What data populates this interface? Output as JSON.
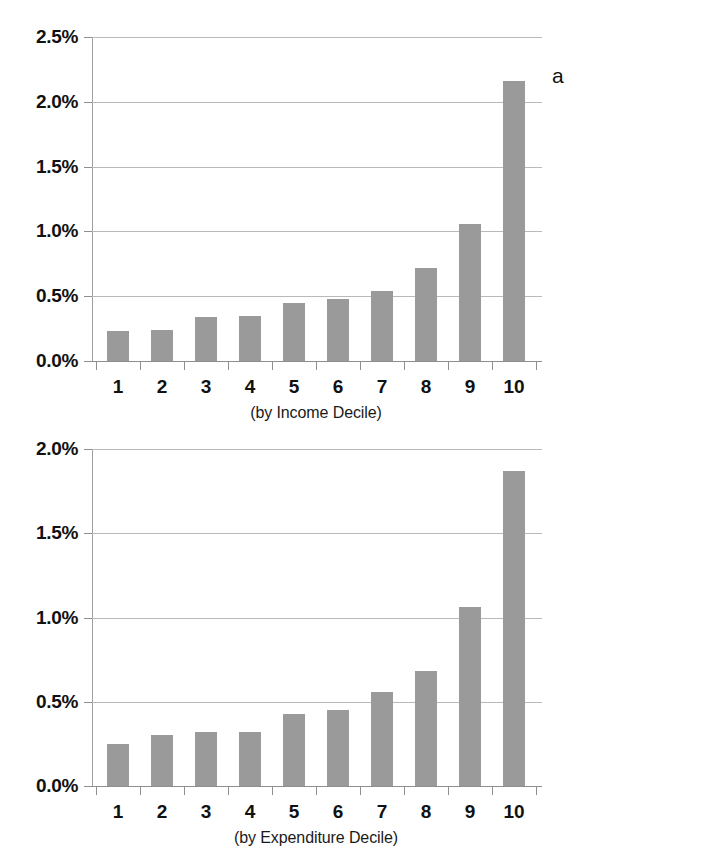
{
  "figure": {
    "panel_a_letter": "a",
    "panel_b_letter": "b",
    "caption": ""
  },
  "chart_data": [
    {
      "id": "a",
      "type": "bar",
      "title": "",
      "xlabel": "(by Income Decile)",
      "ylabel": "",
      "categories": [
        "1",
        "2",
        "3",
        "4",
        "5",
        "6",
        "7",
        "8",
        "9",
        "10"
      ],
      "values": [
        0.23,
        0.24,
        0.34,
        0.35,
        0.45,
        0.48,
        0.54,
        0.72,
        1.06,
        2.16
      ],
      "value_unit": "%",
      "ylim": [
        0,
        2.5
      ],
      "ytick_values": [
        0.0,
        0.5,
        1.0,
        1.5,
        2.0,
        2.5
      ],
      "ytick_labels": [
        "0.0%",
        "0.5%",
        "1.0%",
        "1.5%",
        "2.0%",
        "2.5%"
      ],
      "grid": true,
      "legend": "none",
      "bar_color": "#9a9a9a",
      "gridline_color": "#b9b9b9",
      "panel_label": "a"
    },
    {
      "id": "b",
      "type": "bar",
      "title": "",
      "xlabel": "(by Expenditure Decile)",
      "ylabel": "",
      "categories": [
        "1",
        "2",
        "3",
        "4",
        "5",
        "6",
        "7",
        "8",
        "9",
        "10"
      ],
      "values": [
        0.25,
        0.3,
        0.32,
        0.32,
        0.43,
        0.45,
        0.56,
        0.68,
        1.06,
        1.87
      ],
      "value_unit": "%",
      "ylim": [
        0,
        2.0
      ],
      "ytick_values": [
        0.0,
        0.5,
        1.0,
        1.5,
        2.0
      ],
      "ytick_labels": [
        "0.0%",
        "0.5%",
        "1.0%",
        "1.5%",
        "2.0%"
      ],
      "grid": true,
      "legend": "none",
      "bar_color": "#9a9a9a",
      "gridline_color": "#b9b9b9",
      "panel_label": "b"
    }
  ]
}
